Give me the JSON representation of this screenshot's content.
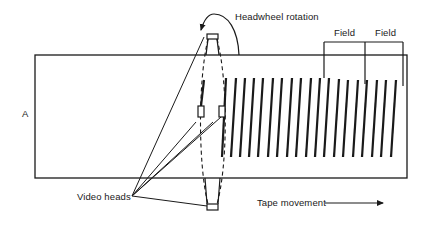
{
  "diagram": {
    "labels": {
      "headwheel_rotation": "Headwheel rotation",
      "field_1": "Field",
      "field_2": "Field",
      "edge_marker": "A",
      "video_heads": "Video heads",
      "tape_movement": "Tape movement"
    },
    "components": {
      "tape": "Magnetic tape",
      "headwheel": "Rotating headwheel (dashed ellipse)",
      "heads": [
        "top head",
        "middle head left",
        "middle head right",
        "bottom head"
      ],
      "tracks": "Slanted recorded video tracks",
      "field_brackets": 2
    },
    "colors": {
      "ink": "#1a1a1a",
      "background": "#ffffff"
    }
  }
}
